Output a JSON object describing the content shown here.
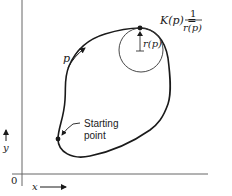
{
  "diagram": {
    "formula": {
      "lhs": "K(p) =",
      "numerator": "1",
      "denominator": "r(p)"
    },
    "radius_label": "r(p)",
    "path_param_label": "p",
    "start_label_line1": "Starting",
    "start_label_line2": "point",
    "axes": {
      "origin_label": "0",
      "x_label": "x",
      "y_label": "y"
    },
    "colors": {
      "stroke": "#1a1a1a",
      "axis": "#555555",
      "background": "#ffffff"
    }
  }
}
